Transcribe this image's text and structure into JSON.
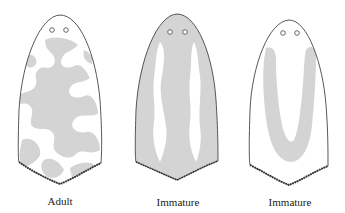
{
  "figures": [
    {
      "label": "Adult",
      "pattern": "mottled irregular gray patches over white"
    },
    {
      "label": "Immature",
      "pattern": "gray body with two white wavy longitudinal stripes"
    },
    {
      "label": "Immature",
      "pattern": "white body with gray U-shaped band"
    }
  ],
  "colors": {
    "outline": "#444444",
    "pattern_gray": "#d4d4d4",
    "background": "#ffffff"
  }
}
